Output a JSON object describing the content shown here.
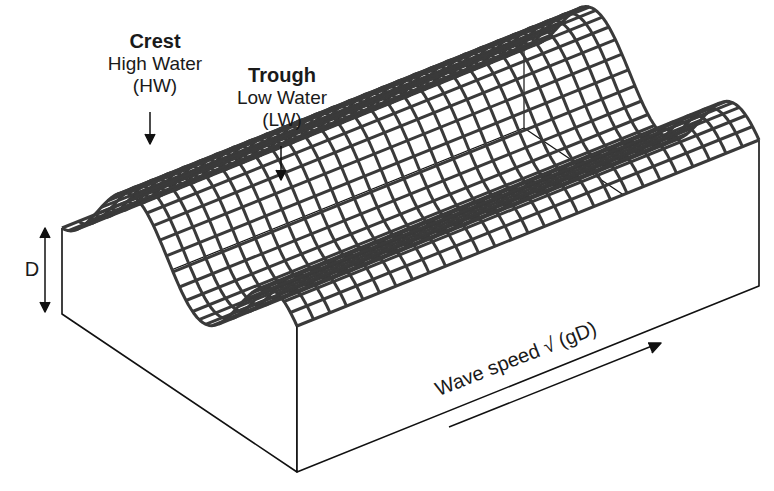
{
  "labels": {
    "crest": {
      "title": "Crest",
      "line1": "High Water",
      "line2": "(HW)"
    },
    "trough": {
      "title": "Trough",
      "line1": "Low Water",
      "line2": "(LW)"
    },
    "depth": "D",
    "wave_speed": "Wave speed √ (gD)"
  },
  "colors": {
    "mesh": "#3a3a3a",
    "edge": "#111111",
    "background": "#ffffff"
  },
  "geometry": {
    "origin": [
      62,
      228
    ],
    "u_axis": [
      235,
      158
    ],
    "v_axis": [
      462,
      -186
    ],
    "base_depth": 86,
    "amplitude": 80,
    "wavelength_u": 0.6,
    "grid_u": 36,
    "grid_v": 28
  }
}
